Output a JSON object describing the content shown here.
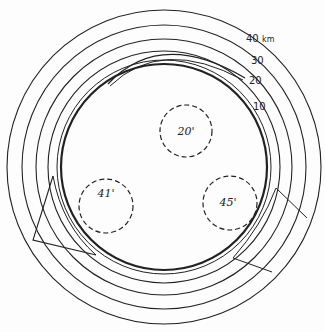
{
  "diagram": {
    "center": {
      "x": 164,
      "y": 167
    },
    "main_circle": {
      "r": 103,
      "stroke": 2
    },
    "contours": [
      {
        "label": "10",
        "r": 117
      },
      {
        "label": "20",
        "r": 128
      },
      {
        "label": "30",
        "r": 142
      },
      {
        "label": "40 km",
        "r": 157
      }
    ],
    "contour_labels": {
      "c40": "40",
      "unit": "km",
      "c30": "30",
      "c20": "20",
      "c10": "10"
    },
    "craters": [
      {
        "label": "20'",
        "cx": 188,
        "cy": 130,
        "r": 26
      },
      {
        "label": "41'",
        "cx": 106,
        "cy": 205,
        "r": 27
      },
      {
        "label": "45'",
        "cx": 230,
        "cy": 203,
        "r": 27
      }
    ],
    "line_color": "#222222"
  }
}
